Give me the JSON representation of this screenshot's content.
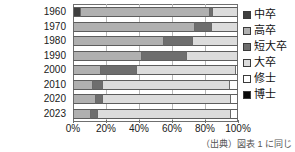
{
  "chart_data": {
    "type": "bar",
    "subtype": "stacked-horizontal-100percent",
    "title": "",
    "xlabel": "",
    "ylabel": "",
    "xlim": [
      0,
      100
    ],
    "xticks": [
      "0%",
      "20%",
      "40%",
      "60%",
      "80%",
      "100%"
    ],
    "xtick_values": [
      0,
      20,
      40,
      60,
      80,
      100
    ],
    "grid": true,
    "legend_position": "right",
    "categories": [
      "1960",
      "1970",
      "1980",
      "1990",
      "2000",
      "2010",
      "2020",
      "2023"
    ],
    "series": [
      {
        "name": "中卒",
        "color": "#3f3f3f",
        "values": [
          5,
          0,
          0,
          0,
          0,
          0,
          0,
          0
        ]
      },
      {
        "name": "高卒",
        "color": "#b0b0b0",
        "values": [
          78,
          74,
          55,
          42,
          17,
          12,
          14,
          11
        ]
      },
      {
        "name": "短大卒",
        "color": "#6e6e6e",
        "values": [
          2,
          10,
          18,
          27,
          22,
          6,
          4,
          4
        ]
      },
      {
        "name": "大卒",
        "color": "#dcdcdc",
        "values": [
          15,
          16,
          27,
          31,
          60,
          77,
          78,
          81
        ]
      },
      {
        "name": "修士",
        "color": "#ffffff",
        "values": [
          0,
          0,
          0,
          0,
          1,
          5,
          4,
          4
        ]
      },
      {
        "name": "博士",
        "color": "#0a0a0a",
        "values": [
          0,
          0,
          0,
          0,
          0,
          0,
          0,
          0
        ]
      }
    ]
  },
  "legend": {
    "items": [
      {
        "label": "中卒",
        "swatch": "#3f3f3f"
      },
      {
        "label": "高卒",
        "swatch": "#b0b0b0"
      },
      {
        "label": "短大卒",
        "swatch": "#6e6e6e"
      },
      {
        "label": "大卒",
        "swatch": "#dcdcdc"
      },
      {
        "label": "修士",
        "swatch": "#ffffff"
      },
      {
        "label": "博士",
        "swatch": "#0a0a0a"
      }
    ]
  },
  "source_note": "（出典）図表 1 に同じ"
}
